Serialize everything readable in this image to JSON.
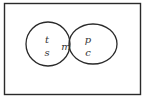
{
  "diagram": {
    "type": "venn",
    "universe": {
      "x": 4,
      "y": 3,
      "width": 137,
      "height": 92,
      "stroke": "#2a2a2a"
    },
    "sets": [
      {
        "name": "left",
        "shape": "circle",
        "cx": 48,
        "cy": 44,
        "r": 22,
        "labels": [
          "t",
          "s"
        ]
      },
      {
        "name": "right",
        "shape": "ellipse",
        "cx": 93,
        "cy": 44,
        "rx": 24,
        "ry": 20,
        "labels": [
          "p",
          "c"
        ]
      }
    ],
    "intersection": {
      "label": "m",
      "fill": "#c8c8c8"
    },
    "labels": {
      "left_top": "t",
      "left_bottom": "s",
      "intersection": "m",
      "right_top": "p",
      "right_bottom": "c"
    }
  }
}
